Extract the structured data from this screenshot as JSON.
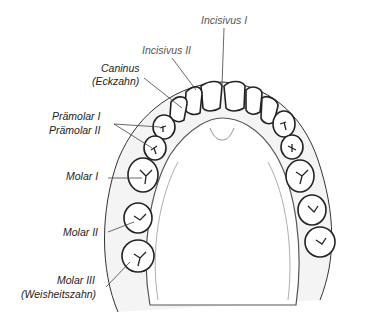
{
  "figure": {
    "labels": {
      "incisivus_1": "Incisivus  I",
      "incisivus_2": "Incisivus  II",
      "caninus_1": "Caninus",
      "caninus_2": "(Eckzahn)",
      "praemolar_1": "Prämolar  I",
      "praemolar_2": "Prämolar  II",
      "molar_1": "Molar  I",
      "molar_2": "Molar  II",
      "molar_3_1": "Molar  III",
      "molar_3_2": "(Weisheitszahn)"
    },
    "colors": {
      "ink": "#222222",
      "tooth_fill": "#ffffff",
      "gum_shade": "#cfcfcf"
    }
  }
}
